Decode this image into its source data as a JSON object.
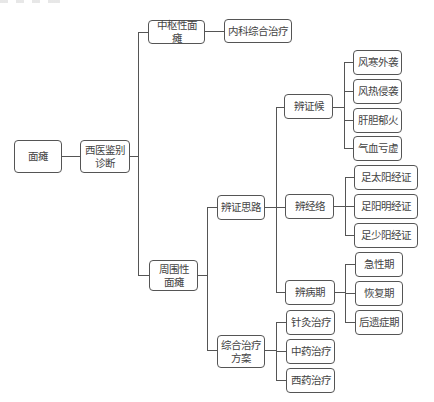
{
  "diagram": {
    "type": "tree",
    "root": {
      "label": "面瘫",
      "children": [
        {
          "label": "西医鉴别\n诊断",
          "children": [
            {
              "label": "中枢性面瘫",
              "children": [
                {
                  "label": "内科综合治疗"
                }
              ]
            },
            {
              "label": "周围性\n面瘫",
              "children": [
                {
                  "label": "辨证思路",
                  "children": [
                    {
                      "label": "辨证候",
                      "children": [
                        {
                          "label": "风寒外袭"
                        },
                        {
                          "label": "风热侵袭"
                        },
                        {
                          "label": "肝胆郁火"
                        },
                        {
                          "label": "气血亏虚"
                        }
                      ]
                    },
                    {
                      "label": "辨经络",
                      "children": [
                        {
                          "label": "足太阳经证"
                        },
                        {
                          "label": "足阳明经证"
                        },
                        {
                          "label": "足少阳经证"
                        }
                      ]
                    },
                    {
                      "label": "辨病期",
                      "children": [
                        {
                          "label": "急性期"
                        },
                        {
                          "label": "恢复期"
                        },
                        {
                          "label": "后遗症期"
                        }
                      ]
                    }
                  ]
                },
                {
                  "label": "综合治疗\n方案",
                  "children": [
                    {
                      "label": "针灸治疗"
                    },
                    {
                      "label": "中药治疗"
                    },
                    {
                      "label": "西药治疗"
                    }
                  ]
                }
              ]
            }
          ]
        }
      ]
    }
  },
  "nodes": {
    "root": "面瘫",
    "western_diagnosis": "西医鉴别\n诊断",
    "central": "中枢性面瘫",
    "internal_treatment": "内科综合治疗",
    "peripheral": "周围性\n面瘫",
    "differentiation": "辨证思路",
    "comprehensive": "综合治疗\n方案",
    "syndrome": "辨证候",
    "meridian": "辨经络",
    "stage": "辨病期",
    "wind_cold": "风寒外袭",
    "wind_heat": "风热侵袭",
    "liver_fire": "肝胆郁火",
    "qi_blood": "气血亏虚",
    "taiyang": "足太阳经证",
    "yangming": "足阳明经证",
    "shaoyang": "足少阳经证",
    "acute": "急性期",
    "recovery": "恢复期",
    "sequela": "后遗症期",
    "acupuncture": "针灸治疗",
    "tcm_herbal": "中药治疗",
    "western_drug": "西药治疗"
  },
  "colors": {
    "line": "#555555",
    "text": "#444444",
    "background": "#ffffff"
  }
}
